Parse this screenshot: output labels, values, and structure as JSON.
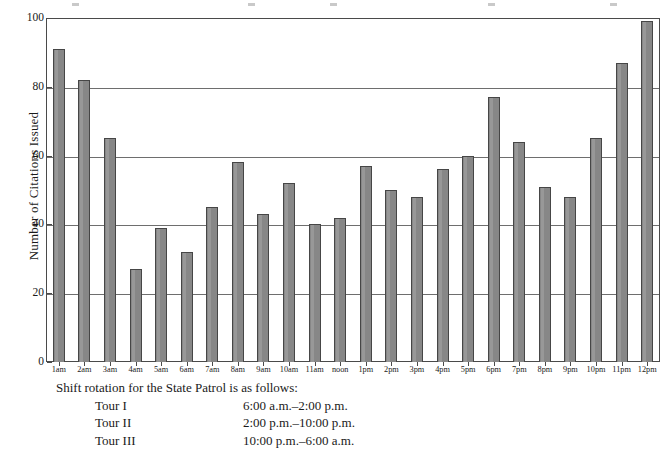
{
  "chart_data": {
    "type": "bar",
    "title": "",
    "subtitle": "",
    "xlabel": "",
    "ylabel": "Number of Citations Issued",
    "ylim": [
      0,
      100
    ],
    "yticks": [
      0,
      20,
      40,
      60,
      80,
      100
    ],
    "grid": true,
    "legend": "none",
    "bar_color": "#878787",
    "bar_edge_color": "#464646",
    "categories": [
      "1am",
      "2am",
      "3am",
      "4am",
      "5am",
      "6am",
      "7am",
      "8am",
      "9am",
      "10am",
      "11am",
      "noon",
      "1pm",
      "2pm",
      "3pm",
      "4pm",
      "5pm",
      "6pm",
      "7pm",
      "8pm",
      "9pm",
      "10pm",
      "11pm",
      "12pm"
    ],
    "values": [
      91,
      82,
      65,
      27,
      39,
      32,
      45,
      58,
      43,
      52,
      40,
      42,
      57,
      50,
      48,
      56,
      60,
      77,
      64,
      51,
      48,
      65,
      87,
      99
    ]
  },
  "note": {
    "intro": "Shift rotation for the State Patrol is as follows:",
    "rows": [
      {
        "name": "Tour I",
        "time": "6:00 a.m.–2:00 p.m."
      },
      {
        "name": "Tour II",
        "time": "2:00 p.m.–10:00 p.m."
      },
      {
        "name": "Tour III",
        "time": "10:00 p.m.–6:00 a.m."
      }
    ]
  }
}
